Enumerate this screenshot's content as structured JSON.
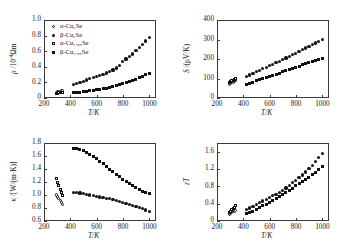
{
  "figure": {
    "background": "#ffffff",
    "marker_color": "#111111",
    "axis_color": "#3a3a3a"
  },
  "legend": {
    "entries": [
      {
        "label": "α-Cu₂Se",
        "marker": "open-circle",
        "series": "alpha-Cu2Se"
      },
      {
        "label": "β-Cu₂Se",
        "marker": "filled-circle",
        "series": "beta-Cu2Se"
      },
      {
        "label": "α-Cu₁.₉₈Se",
        "marker": "open-square",
        "series": "alpha-Cu1.98Se"
      },
      {
        "label": "β-Cu₁.₉₈Se",
        "marker": "filled-square",
        "series": "beta-Cu1.98Se"
      }
    ]
  },
  "chart_data": [
    {
      "id": "resistivity",
      "type": "scatter",
      "title": "",
      "xlabel": "T/K",
      "ylabel": "ρ /10⁻⁴Ωm",
      "xlim": [
        200,
        1050
      ],
      "ylim": [
        0,
        1.0
      ],
      "xticks": [
        200,
        400,
        600,
        800,
        1000
      ],
      "yticks": [
        0,
        0.2,
        0.4,
        0.6,
        0.8,
        1.0
      ],
      "ytick_labels": [
        "0",
        "0.2",
        "0.4",
        "0.6",
        "0.8",
        "1.0"
      ],
      "grid": false,
      "legend_position": "top-left",
      "series": [
        {
          "name": "α-Cu₂Se",
          "marker": "open-circle",
          "x": [
            293,
            303,
            313,
            323,
            333,
            343
          ],
          "y": [
            0.075,
            0.078,
            0.082,
            0.086,
            0.09,
            0.094
          ]
        },
        {
          "name": "β-Cu₂Se",
          "marker": "filled-circle",
          "x": [
            423,
            448,
            473,
            498,
            523,
            548,
            573,
            598,
            623,
            648,
            673,
            698,
            723,
            748,
            773,
            798,
            823,
            848,
            873,
            898,
            923,
            948,
            973,
            998
          ],
          "y": [
            0.175,
            0.19,
            0.2,
            0.215,
            0.23,
            0.245,
            0.258,
            0.275,
            0.29,
            0.3,
            0.32,
            0.34,
            0.36,
            0.385,
            0.42,
            0.47,
            0.5,
            0.53,
            0.565,
            0.61,
            0.65,
            0.69,
            0.73,
            0.775
          ]
        },
        {
          "name": "α-Cu₁.₉₈Se",
          "marker": "open-square",
          "x": [
            293,
            303,
            313,
            323,
            333,
            343
          ],
          "y": [
            0.06,
            0.062,
            0.065,
            0.068,
            0.07,
            0.073
          ]
        },
        {
          "name": "β-Cu₁.₉₈Se",
          "marker": "filled-square",
          "x": [
            423,
            448,
            473,
            498,
            523,
            548,
            573,
            598,
            623,
            648,
            673,
            698,
            723,
            748,
            773,
            798,
            823,
            848,
            873,
            898,
            923,
            948,
            973,
            998
          ],
          "y": [
            0.068,
            0.07,
            0.075,
            0.08,
            0.085,
            0.09,
            0.098,
            0.105,
            0.112,
            0.12,
            0.128,
            0.138,
            0.148,
            0.158,
            0.17,
            0.182,
            0.196,
            0.21,
            0.225,
            0.242,
            0.262,
            0.28,
            0.3,
            0.318
          ]
        }
      ]
    },
    {
      "id": "seebeck",
      "type": "scatter",
      "title": "",
      "xlabel": "T/K",
      "ylabel": "S /(μV/K)",
      "xlim": [
        200,
        1050
      ],
      "ylim": [
        0,
        400
      ],
      "xticks": [
        200,
        400,
        600,
        800,
        1000
      ],
      "yticks": [
        0,
        100,
        200,
        300,
        400
      ],
      "ytick_labels": [
        "0",
        "100",
        "200",
        "300",
        "400"
      ],
      "grid": false,
      "legend_position": "none",
      "series": [
        {
          "name": "α-Cu₂Se",
          "marker": "open-circle",
          "x": [
            293,
            303,
            313,
            323,
            333,
            343
          ],
          "y": [
            70,
            74,
            78,
            82,
            86,
            90
          ]
        },
        {
          "name": "β-Cu₂Se",
          "marker": "filled-circle",
          "x": [
            423,
            448,
            473,
            498,
            523,
            548,
            573,
            598,
            623,
            648,
            673,
            698,
            723,
            748,
            773,
            798,
            823,
            848,
            873,
            898,
            923,
            948,
            973,
            998
          ],
          "y": [
            110,
            118,
            127,
            134,
            142,
            150,
            158,
            165,
            173,
            181,
            188,
            196,
            205,
            213,
            222,
            230,
            240,
            248,
            256,
            265,
            274,
            282,
            291,
            300
          ]
        },
        {
          "name": "α-Cu₁.₉₈Se",
          "marker": "open-square",
          "x": [
            293,
            303,
            313,
            323,
            333,
            343
          ],
          "y": [
            80,
            84,
            88,
            92,
            96,
            100
          ]
        },
        {
          "name": "β-Cu₁.₉₈Se",
          "marker": "filled-square",
          "x": [
            423,
            448,
            473,
            498,
            523,
            548,
            573,
            598,
            623,
            648,
            673,
            698,
            723,
            748,
            773,
            798,
            823,
            848,
            873,
            898,
            923,
            948,
            973,
            998
          ],
          "y": [
            70,
            76,
            82,
            88,
            93,
            99,
            105,
            110,
            116,
            122,
            128,
            134,
            140,
            146,
            152,
            158,
            164,
            170,
            176,
            182,
            188,
            193,
            199,
            205
          ]
        }
      ]
    },
    {
      "id": "thermal-conductivity",
      "type": "scatter",
      "title": "",
      "xlabel": "T/K",
      "ylabel": "κ /[W/(m·K)]",
      "xlim": [
        200,
        1050
      ],
      "ylim": [
        0.6,
        1.8
      ],
      "xticks": [
        200,
        400,
        600,
        800,
        1000
      ],
      "yticks": [
        0.6,
        0.8,
        1.0,
        1.2,
        1.4,
        1.6,
        1.8
      ],
      "ytick_labels": [
        "0.6",
        "0.8",
        "1.0",
        "1.2",
        "1.4",
        "1.6",
        "1.8"
      ],
      "grid": false,
      "legend_position": "none",
      "series": [
        {
          "name": "α-Cu₂Se",
          "marker": "open-circle",
          "x": [
            293,
            303,
            313,
            323,
            333,
            343
          ],
          "y": [
            1.0,
            0.97,
            0.94,
            0.91,
            0.88,
            0.85
          ]
        },
        {
          "name": "β-Cu₂Se",
          "marker": "filled-circle",
          "x": [
            423,
            448,
            473,
            498,
            523,
            548,
            573,
            598,
            623,
            648,
            673,
            698,
            723,
            748,
            773,
            798,
            823,
            848,
            873,
            898,
            923,
            948,
            973,
            998
          ],
          "y": [
            1.04,
            1.04,
            1.03,
            1.02,
            1.01,
            1.0,
            0.99,
            0.98,
            0.97,
            0.96,
            0.95,
            0.94,
            0.93,
            0.91,
            0.9,
            0.89,
            0.87,
            0.86,
            0.84,
            0.82,
            0.81,
            0.79,
            0.77,
            0.75
          ]
        },
        {
          "name": "α-Cu₁.₉₈Se",
          "marker": "open-square",
          "x": [
            293,
            303,
            313,
            323,
            333,
            343
          ],
          "y": [
            1.25,
            1.2,
            1.14,
            1.09,
            1.04,
            1.0
          ]
        },
        {
          "name": "β-Cu₁.₉₈Se",
          "marker": "filled-square",
          "x": [
            423,
            448,
            473,
            498,
            523,
            548,
            573,
            598,
            623,
            648,
            673,
            698,
            723,
            748,
            773,
            798,
            823,
            848,
            873,
            898,
            923,
            948,
            973,
            998
          ],
          "y": [
            1.72,
            1.72,
            1.7,
            1.68,
            1.66,
            1.63,
            1.6,
            1.56,
            1.52,
            1.48,
            1.44,
            1.4,
            1.36,
            1.32,
            1.28,
            1.24,
            1.21,
            1.18,
            1.14,
            1.11,
            1.08,
            1.06,
            1.04,
            1.02
          ]
        }
      ]
    },
    {
      "id": "figure-of-merit",
      "type": "scatter",
      "title": "",
      "xlabel": "T/K",
      "ylabel": "zT",
      "xlim": [
        200,
        1050
      ],
      "ylim": [
        0,
        1.8
      ],
      "xticks": [
        200,
        400,
        600,
        800,
        1000
      ],
      "yticks": [
        0,
        0.4,
        0.8,
        1.2,
        1.6
      ],
      "ytick_labels": [
        "0",
        "0.4",
        "0.8",
        "1.2",
        "1.6"
      ],
      "grid": false,
      "legend_position": "none",
      "series": [
        {
          "name": "α-Cu₂Se",
          "marker": "open-circle",
          "x": [
            293,
            303,
            313,
            323,
            333,
            343
          ],
          "y": [
            0.15,
            0.17,
            0.19,
            0.21,
            0.23,
            0.25
          ]
        },
        {
          "name": "β-Cu₂Se",
          "marker": "filled-circle",
          "x": [
            423,
            448,
            473,
            498,
            523,
            548,
            573,
            598,
            623,
            648,
            673,
            698,
            723,
            748,
            773,
            798,
            823,
            848,
            873,
            898,
            923,
            948,
            973,
            998
          ],
          "y": [
            0.26,
            0.3,
            0.34,
            0.38,
            0.42,
            0.46,
            0.5,
            0.54,
            0.58,
            0.62,
            0.66,
            0.7,
            0.76,
            0.82,
            0.88,
            0.94,
            1.0,
            1.06,
            1.13,
            1.21,
            1.29,
            1.38,
            1.46,
            1.55
          ]
        },
        {
          "name": "α-Cu₁.₉₈Se",
          "marker": "open-square",
          "x": [
            293,
            303,
            313,
            323,
            333,
            343
          ],
          "y": [
            0.2,
            0.23,
            0.26,
            0.29,
            0.32,
            0.35
          ]
        },
        {
          "name": "β-Cu₁.₉₈Se",
          "marker": "filled-square",
          "x": [
            423,
            448,
            473,
            498,
            523,
            548,
            573,
            598,
            623,
            648,
            673,
            698,
            723,
            748,
            773,
            798,
            823,
            848,
            873,
            898,
            923,
            948,
            973,
            998
          ],
          "y": [
            0.17,
            0.2,
            0.23,
            0.27,
            0.31,
            0.35,
            0.39,
            0.43,
            0.47,
            0.51,
            0.56,
            0.61,
            0.66,
            0.71,
            0.76,
            0.81,
            0.86,
            0.91,
            0.96,
            1.01,
            1.07,
            1.13,
            1.19,
            1.25
          ]
        }
      ]
    }
  ]
}
